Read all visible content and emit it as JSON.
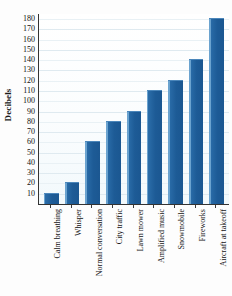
{
  "chart_data": {
    "type": "bar",
    "title": "",
    "xlabel": "",
    "ylabel": "Decibels",
    "categories": [
      "Calm breathing",
      "Whisper",
      "Normal conversation",
      "City traffic",
      "Lawn mower",
      "Amplified music",
      "Snowmobile",
      "Fireworks",
      "Aircraft at takeoff"
    ],
    "values": [
      10,
      20,
      60,
      80,
      90,
      110,
      120,
      140,
      180
    ],
    "ylim": [
      0,
      185
    ],
    "yticks": [
      10,
      20,
      30,
      40,
      50,
      60,
      70,
      80,
      90,
      100,
      110,
      120,
      130,
      140,
      150,
      160,
      170,
      180
    ],
    "grid": true,
    "legend": "none",
    "bar_color": "#1d5b96",
    "bar_edge_color": "#6ba3cf",
    "axis_color": "#333333",
    "gridline_color": "#dfeaf0",
    "plot_background": "#f6fbfd"
  }
}
